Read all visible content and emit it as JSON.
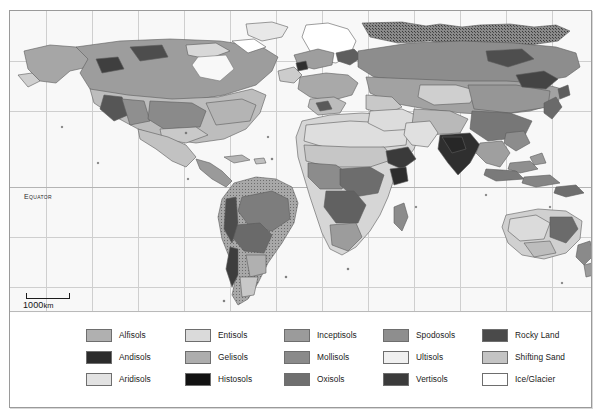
{
  "figure": {
    "kind": "thematic-map"
  },
  "map": {
    "equator_label": "Equator",
    "scale": {
      "distance": "1000",
      "unit": "km"
    },
    "ocean_color": "#f8f8f8",
    "graticule_color": "#cfcfcf",
    "grid_on": true,
    "vertical_gridlines": [
      36,
      82,
      128,
      174,
      220,
      266,
      312,
      358,
      404,
      450,
      496,
      542
    ],
    "horizontal_gridlines": [
      50,
      100,
      176,
      226,
      276
    ],
    "equator_y": 176
  },
  "legend": {
    "columns": 5,
    "rows": 3,
    "items": [
      {
        "label": "Alfisols",
        "color": "#b0b0b0"
      },
      {
        "label": "Entisols",
        "color": "#dadada"
      },
      {
        "label": "Inceptisols",
        "color": "#9b9b9b"
      },
      {
        "label": "Spodosols",
        "color": "#8e8e8e"
      },
      {
        "label": "Rocky Land",
        "color": "#4a4a4a"
      },
      {
        "label": "Andisols",
        "color": "#2b2b2b"
      },
      {
        "label": "Gelisols",
        "color": "#adadad"
      },
      {
        "label": "Mollisols",
        "color": "#8a8a8a"
      },
      {
        "label": "Ultisols",
        "color": "#f0f0f0"
      },
      {
        "label": "Shifting Sand",
        "color": "#c4c4c4"
      },
      {
        "label": "Aridisols",
        "color": "#e2e2e2"
      },
      {
        "label": "Histosols",
        "color": "#121212"
      },
      {
        "label": "Oxisols",
        "color": "#6f6f6f"
      },
      {
        "label": "Vertisols",
        "color": "#3b3b3b"
      },
      {
        "label": "Ice/Glacier",
        "color": "#ffffff"
      }
    ]
  }
}
